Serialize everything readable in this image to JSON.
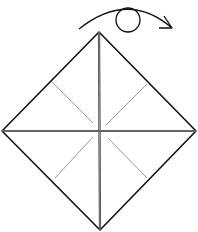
{
  "diagram": {
    "type": "origami-fold-step",
    "colors": {
      "outline": "#111111",
      "crease_main": "#333333",
      "crease_light": "#999999",
      "background": "#ffffff"
    },
    "symbols": [
      {
        "name": "turn-over-arrow",
        "meaning": "turn over"
      }
    ]
  }
}
